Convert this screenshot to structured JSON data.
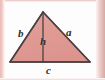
{
  "figure": {
    "kind": "geometry-diagram",
    "shape": "triangle",
    "colors": {
      "fill": "#e09a94",
      "fill_highlight": "#e8b0aa",
      "stroke": "#4a4140",
      "altitude_stroke": "#4a4140",
      "label_text": "#2b2b2b",
      "page_edge": "#e1b0ab",
      "background": "#fefdfd"
    },
    "labels": {
      "side_b": "b",
      "side_a": "a",
      "height_h": "h",
      "base_c": "c"
    },
    "geometry": {
      "apex": [
        43,
        12
      ],
      "bottom_left": [
        10,
        62
      ],
      "bottom_right": [
        90,
        62
      ],
      "altitude_foot": [
        43,
        62
      ],
      "stroke_width": 1.4
    }
  }
}
